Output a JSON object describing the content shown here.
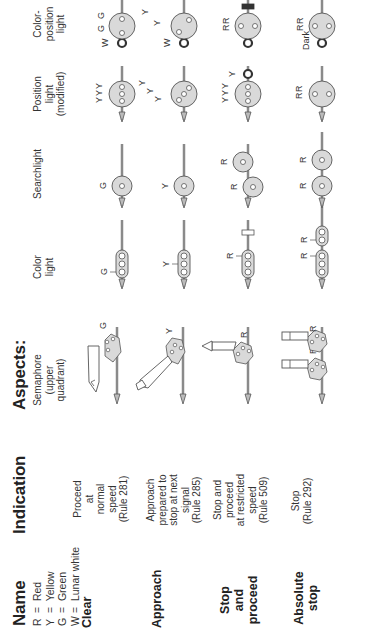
{
  "headers": {
    "name": "Name",
    "indication": "Indication",
    "aspects": "Aspects:"
  },
  "legend": [
    {
      "key": "R",
      "eq": "=",
      "value": "Red"
    },
    {
      "key": "Y",
      "eq": "=",
      "value": "Yellow"
    },
    {
      "key": "G",
      "eq": "=",
      "value": "Green"
    },
    {
      "key": "W",
      "eq": "=",
      "value": "Lunar white"
    }
  ],
  "columns": {
    "semaphore": [
      "Semaphore",
      "(upper",
      "quadrant)"
    ],
    "color_light": [
      "Color",
      "light"
    ],
    "searchlight": [
      "Searchlight"
    ],
    "position_light": [
      "Position",
      "light",
      "(modified)"
    ],
    "color_position_light": [
      "Color-",
      "position",
      "light"
    ]
  },
  "rows": [
    {
      "name": [
        "Clear"
      ],
      "indication": [
        "Proceed",
        "at",
        "normal",
        "speed",
        "(Rule 281)"
      ],
      "aspects": {
        "semaphore": "G",
        "color_light": "G",
        "searchlight": "G",
        "position_light": [
          "Y",
          "Y",
          "Y"
        ],
        "color_position_light": [
          "W",
          "G",
          "G"
        ]
      }
    },
    {
      "name": [
        "Approach"
      ],
      "indication": [
        "Approach",
        "prepared to",
        "stop at next",
        "signal",
        "(Rule 285)"
      ],
      "aspects": {
        "semaphore": "Y",
        "color_light": "Y",
        "searchlight": "Y",
        "position_light": [
          "Y",
          "Y",
          "Y"
        ],
        "color_position_light": [
          "W",
          "Y",
          "Y"
        ]
      }
    },
    {
      "name": [
        "Stop",
        "and",
        "proceed"
      ],
      "indication": [
        "Stop and",
        "proceed",
        "at restricted",
        "speed",
        "(Rule 509)"
      ],
      "aspects": {
        "semaphore": "R",
        "color_light": "R",
        "searchlight": [
          "R",
          "R"
        ],
        "position_light": [
          "Y",
          "Y",
          "Y",
          "Y"
        ],
        "color_position_light": [
          "R",
          "R"
        ]
      }
    },
    {
      "name": [
        "Absolute",
        "stop"
      ],
      "indication": [
        "Stop",
        "(Rule 292)"
      ],
      "aspects": {
        "semaphore": [
          "R",
          "R"
        ],
        "color_light": [
          "R",
          "R"
        ],
        "searchlight": [
          "R",
          "R"
        ],
        "position_light": [
          "R",
          "R"
        ],
        "color_position_light": [
          "Dark",
          "R",
          "R"
        ]
      }
    }
  ],
  "colors": {
    "lamp_fill": "#d9d9d9",
    "stroke": "#555555",
    "mast": "#8a8a8a",
    "marker_dark": "#333333"
  }
}
